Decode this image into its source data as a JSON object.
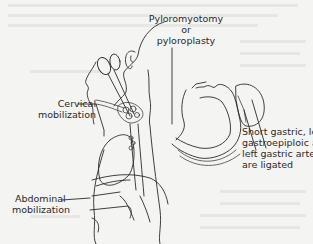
{
  "diagram": {
    "labels": {
      "pyloro_line1": "Pyloromyotomy",
      "pyloro_line2": "or",
      "pyloro_line3": "pyloroplasty",
      "cervical_line1": "Cervical",
      "cervical_line2": "mobilization",
      "abdominal_line1": "Abdominal",
      "abdominal_line2": "mobilization",
      "ligated_line1": "Short gastric, left",
      "ligated_line2": "gastroepiploic and",
      "ligated_line3": "left gastric arteries",
      "ligated_line4": "are ligated"
    },
    "colors": {
      "background": "#f4f4f2",
      "ink": "#2a2a2a",
      "bleed_through": "#e6e6e3"
    }
  }
}
